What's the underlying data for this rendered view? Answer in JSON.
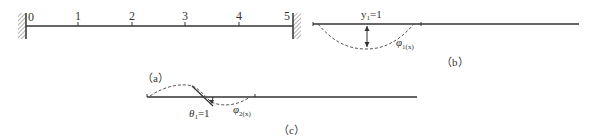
{
  "figure_a": {
    "caption": "（a）",
    "node_labels": [
      "0",
      "1",
      "2",
      "3",
      "4",
      "5"
    ],
    "supports": [
      "fixed-left",
      "fixed-right"
    ]
  },
  "figure_b": {
    "caption": "（b）",
    "displacement_label_main": "y",
    "displacement_label_sub": "1",
    "displacement_label_eq": "=1",
    "shape_fn_main": "φ",
    "shape_fn_sub": "1(x)"
  },
  "figure_c": {
    "caption": "（c）",
    "rotation_label_main": "θ",
    "rotation_label_sub": "1",
    "rotation_label_eq": "=1",
    "shape_fn_main": "φ",
    "shape_fn_sub": "2(x)"
  },
  "colors": {
    "line": "#333333",
    "dashed": "#555555",
    "hatch": "#666666"
  }
}
